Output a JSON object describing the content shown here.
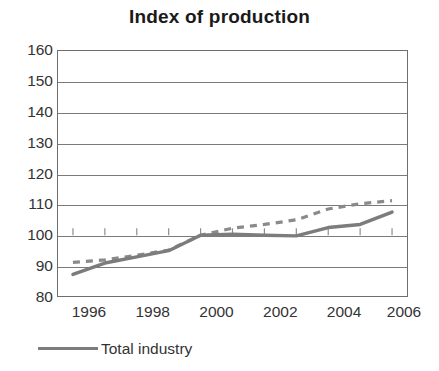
{
  "chart_data": {
    "type": "line",
    "title": "Index of production",
    "xlabel": "",
    "ylabel": "",
    "xlim": [
      1995.5,
      2006.5
    ],
    "ylim": [
      80,
      160
    ],
    "grid": true,
    "legend_position": "bottom-left",
    "yticks": [
      160,
      150,
      140,
      130,
      120,
      110,
      100,
      90,
      80
    ],
    "xticks": [
      1996,
      1998,
      2000,
      2002,
      2004,
      2006
    ],
    "xtick_labels": [
      "1996",
      "1998",
      "2000",
      "2002",
      "2004",
      "2006"
    ],
    "x": [
      1996,
      1997,
      1998,
      1999,
      2000,
      2001,
      2002,
      2003,
      2004,
      2005,
      2006
    ],
    "series": [
      {
        "name": "Total industry",
        "style": "solid",
        "color": "#7c7c7c",
        "values": [
          87.3,
          91.0,
          93.0,
          95.0,
          100.0,
          100.3,
          100.0,
          99.8,
          102.5,
          103.5,
          107.5
        ]
      },
      {
        "name": "",
        "style": "dashed",
        "color": "#8a8a8a",
        "values": [
          91.2,
          92.0,
          93.5,
          95.2,
          100.0,
          102.3,
          103.5,
          105.0,
          108.5,
          110.2,
          111.2
        ]
      }
    ]
  },
  "legend": {
    "items": [
      {
        "label": "Total industry",
        "color": "#7c7c7c",
        "style": "solid"
      }
    ]
  }
}
